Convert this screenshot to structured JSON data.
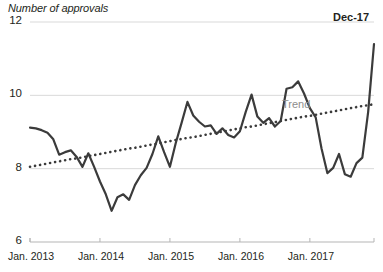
{
  "chart_data": {
    "type": "line",
    "title": "Number of approvals",
    "ylabel": "Number of approvals",
    "xlabel": "",
    "ylim": [
      6,
      12
    ],
    "xlim": [
      "Jan. 2013",
      "Dec. 2017"
    ],
    "grid": true,
    "gridlines_y": [
      8,
      10,
      12
    ],
    "legend": "none",
    "ytick_labels": [
      "12",
      "10",
      "8",
      "6"
    ],
    "ytick_values": [
      12,
      10,
      8,
      6
    ],
    "xtick_labels": [
      "Jan. 2013",
      "Jan. 2014",
      "Jan. 2015",
      "Jan. 2016",
      "Jan. 2017"
    ],
    "xtick_values": [
      "2013-01",
      "2014-01",
      "2015-01",
      "2016-01",
      "2017-01"
    ],
    "annotations": [
      {
        "text": "Dec-17",
        "target": "final data point",
        "color": "#231f20"
      },
      {
        "text": "Trend",
        "target": "trend line",
        "color": "#8d8d8d"
      }
    ],
    "x": [
      "2013-01",
      "2013-02",
      "2013-03",
      "2013-04",
      "2013-05",
      "2013-06",
      "2013-07",
      "2013-08",
      "2013-09",
      "2013-10",
      "2013-11",
      "2013-12",
      "2014-01",
      "2014-02",
      "2014-03",
      "2014-04",
      "2014-05",
      "2014-06",
      "2014-07",
      "2014-08",
      "2014-09",
      "2014-10",
      "2014-11",
      "2014-12",
      "2015-01",
      "2015-02",
      "2015-03",
      "2015-04",
      "2015-05",
      "2015-06",
      "2015-07",
      "2015-08",
      "2015-09",
      "2015-10",
      "2015-11",
      "2015-12",
      "2016-01",
      "2016-02",
      "2016-03",
      "2016-04",
      "2016-05",
      "2016-06",
      "2016-07",
      "2016-08",
      "2016-09",
      "2016-10",
      "2016-11",
      "2016-12",
      "2017-01",
      "2017-02",
      "2017-03",
      "2017-04",
      "2017-05",
      "2017-06",
      "2017-07",
      "2017-08",
      "2017-09",
      "2017-10",
      "2017-11",
      "2017-12"
    ],
    "series": [
      {
        "name": "Number of approvals",
        "color": "#3b3b3b",
        "style": "solid",
        "width": 2.2,
        "values": [
          9.12,
          9.1,
          9.05,
          8.98,
          8.8,
          8.38,
          8.45,
          8.5,
          8.32,
          8.05,
          8.42,
          8.05,
          7.65,
          7.3,
          6.85,
          7.22,
          7.3,
          7.15,
          7.55,
          7.82,
          8.02,
          8.4,
          8.88,
          8.45,
          8.05,
          8.7,
          9.25,
          9.82,
          9.45,
          9.28,
          9.15,
          9.18,
          8.95,
          9.1,
          8.92,
          8.85,
          9.02,
          9.55,
          10.02,
          9.42,
          9.25,
          9.38,
          9.15,
          9.3,
          10.18,
          10.22,
          10.38,
          10.05,
          9.65,
          9.4,
          8.55,
          7.88,
          8.02,
          8.4,
          7.85,
          7.78,
          8.15,
          8.3,
          9.55,
          11.4
        ]
      },
      {
        "name": "Trend",
        "color": "#3b3b3b",
        "style": "dotted",
        "width": 2.6,
        "values": [
          8.05,
          8.08,
          8.11,
          8.14,
          8.17,
          8.2,
          8.23,
          8.26,
          8.28,
          8.31,
          8.34,
          8.37,
          8.4,
          8.43,
          8.46,
          8.49,
          8.52,
          8.55,
          8.57,
          8.6,
          8.63,
          8.66,
          8.69,
          8.72,
          8.75,
          8.78,
          8.81,
          8.84,
          8.86,
          8.89,
          8.92,
          8.95,
          8.98,
          9.01,
          9.04,
          9.07,
          9.1,
          9.13,
          9.15,
          9.18,
          9.21,
          9.24,
          9.27,
          9.3,
          9.33,
          9.36,
          9.39,
          9.42,
          9.44,
          9.47,
          9.5,
          9.53,
          9.56,
          9.59,
          9.62,
          9.65,
          9.68,
          9.71,
          9.73,
          9.76
        ]
      }
    ]
  },
  "labels": {
    "axis_title": "Number of approvals",
    "endpoint": "Dec-17",
    "trend": "Trend"
  },
  "colors": {
    "line": "#3b3b3b",
    "trend": "#3b3b3b",
    "trend_label": "#8d8d8d",
    "grid": "#d9d9d9",
    "axis": "#b5b5b5",
    "text": "#231f20",
    "background": "#ffffff"
  }
}
